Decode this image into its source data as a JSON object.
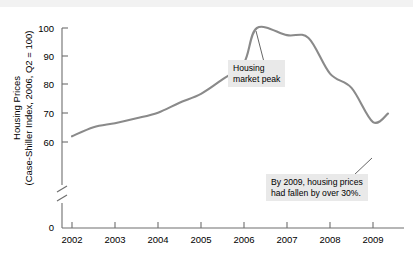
{
  "chart_data": {
    "type": "line",
    "title": "",
    "xlabel": "",
    "ylabel": "Housing Prices (Case-Shiller Index, 2006, Q2 = 100)",
    "ylabel_line1": "Housing Prices",
    "ylabel_line2": "(Case-Shiller Index, 2006, Q2 = 100)",
    "x_tick_labels": [
      "2002",
      "2003",
      "2004",
      "2005",
      "2006",
      "2007",
      "2008",
      "2009"
    ],
    "y_tick_labels": [
      "0",
      "60",
      "70",
      "80",
      "90",
      "100"
    ],
    "ylim": [
      60,
      100
    ],
    "xlim": [
      2002,
      2009.35
    ],
    "y_axis_break": true,
    "y_axis_break_between": [
      0,
      60
    ],
    "grid": false,
    "legend": false,
    "line_color": "#8a8a8a",
    "x": [
      2002.0,
      2002.25,
      2002.5,
      2002.75,
      2003.0,
      2003.25,
      2003.5,
      2003.75,
      2004.0,
      2004.25,
      2004.5,
      2004.75,
      2005.0,
      2005.25,
      2005.5,
      2005.75,
      2006.0,
      2006.25,
      2006.5,
      2006.75,
      2007.0,
      2007.25,
      2007.5,
      2007.75,
      2008.0,
      2008.25,
      2008.5,
      2008.75,
      2009.0,
      2009.35
    ],
    "values": [
      62.0,
      63.5,
      65.2,
      66.1,
      66.6,
      67.4,
      68.3,
      69.2,
      70.3,
      72.0,
      73.8,
      75.5,
      76.9,
      79.3,
      82.0,
      85.0,
      87.8,
      91.5,
      95.5,
      98.3,
      99.8,
      99.3,
      98.3,
      97.4,
      96.8,
      95.7,
      92.0,
      88.3,
      84.0,
      82.3
    ],
    "series": [
      {
        "name": "Case-Shiller Housing Price Index",
        "points": [
          {
            "x": "2002.00",
            "y": 62.0
          },
          {
            "x": "2002.50",
            "y": 65.2
          },
          {
            "x": "2003.00",
            "y": 66.6
          },
          {
            "x": "2003.50",
            "y": 68.3
          },
          {
            "x": "2004.00",
            "y": 70.3
          },
          {
            "x": "2004.50",
            "y": 73.8
          },
          {
            "x": "2005.00",
            "y": 76.9
          },
          {
            "x": "2005.50",
            "y": 82.0
          },
          {
            "x": "2006.00",
            "y": 87.8
          },
          {
            "x": "2006.30",
            "y": 100.0
          },
          {
            "x": "2007.00",
            "y": 97.5
          },
          {
            "x": "2007.50",
            "y": 96.5
          },
          {
            "x": "2008.00",
            "y": 84.0
          },
          {
            "x": "2008.50",
            "y": 79.0
          },
          {
            "x": "2009.00",
            "y": 67.0
          },
          {
            "x": "2009.35",
            "y": 70.0
          }
        ]
      }
    ],
    "annotations": [
      {
        "id": "housing-market-peak",
        "line1": "Housing",
        "line2": "market peak",
        "text": "Housing market peak",
        "points_to_x": 2006.3,
        "points_to_y": 100.0
      },
      {
        "id": "price-decline",
        "line1": "By 2009, housing prices",
        "line2": "had fallen by over 30%.",
        "text": "By 2009, housing prices had fallen by over 30%.",
        "points_to_x": 2009.0,
        "points_to_y": 67.0
      }
    ]
  }
}
